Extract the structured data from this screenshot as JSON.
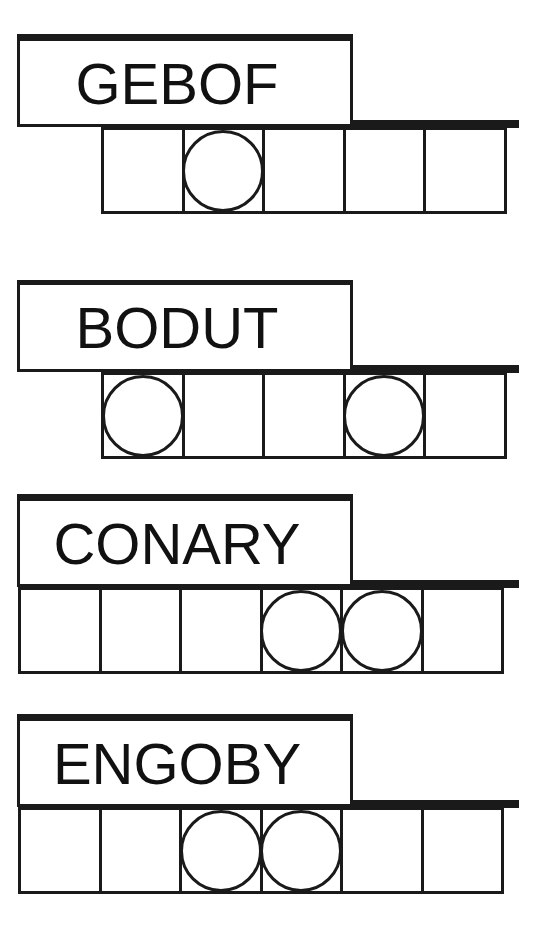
{
  "game": "jumble-word-puzzle",
  "colors": {
    "ink": "#1a1a1a",
    "background": "#ffffff"
  },
  "puzzles": [
    {
      "scrambled": "GEBOF",
      "length": 5,
      "circled_positions": [
        2
      ],
      "answer": [
        "",
        "",
        "",
        "",
        ""
      ]
    },
    {
      "scrambled": "BODUT",
      "length": 5,
      "circled_positions": [
        1,
        4
      ],
      "answer": [
        "",
        "",
        "",
        "",
        ""
      ]
    },
    {
      "scrambled": "CONARY",
      "length": 6,
      "circled_positions": [
        4,
        5
      ],
      "answer": [
        "",
        "",
        "",
        "",
        "",
        ""
      ]
    },
    {
      "scrambled": "ENGOBY",
      "length": 6,
      "circled_positions": [
        3,
        4
      ],
      "answer": [
        "",
        "",
        "",
        "",
        "",
        ""
      ]
    }
  ]
}
